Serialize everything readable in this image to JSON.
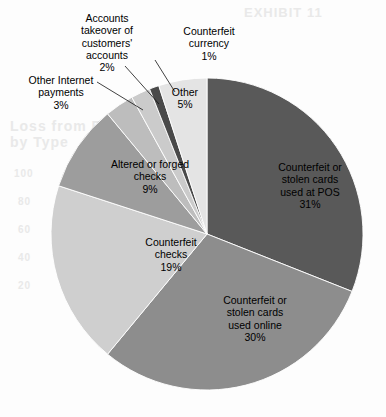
{
  "chart_data": {
    "type": "pie",
    "title": "",
    "legend_position": "none",
    "grid": false,
    "categories": [
      "Counterfeit or stolen cards used at POS",
      "Counterfeit or stolen cards used online",
      "Counterfeit checks",
      "Altered or forged checks",
      "Other Internet payments",
      "Accounts takeover of customers' accounts",
      "Counterfeit currency",
      "Other"
    ],
    "values": [
      31,
      30,
      19,
      9,
      3,
      2,
      1,
      5
    ],
    "units": "percent",
    "slices": [
      {
        "label": "Counterfeit or\nstolen cards\nused at POS",
        "value_label": "31%",
        "value": 31,
        "color": "#595959",
        "label_placement": "inside",
        "label_x": 264,
        "label_y": 161,
        "label_width": 92
      },
      {
        "label": "Counterfeit or\nstolen cards\nused online",
        "value_label": "30%",
        "value": 30,
        "color": "#8d8d8d",
        "label_placement": "inside",
        "label_x": 206,
        "label_y": 294,
        "label_width": 98
      },
      {
        "label": "Counterfeit\nchecks",
        "value_label": "19%",
        "value": 19,
        "color": "#cfcfcf",
        "label_placement": "inside",
        "label_x": 128,
        "label_y": 236,
        "label_width": 86
      },
      {
        "label": "Altered or forged\nchecks",
        "value_label": "9%",
        "value": 9,
        "color": "#9d9d9d",
        "label_placement": "inside",
        "label_x": 92,
        "label_y": 158,
        "label_width": 116
      },
      {
        "label": "Other Internet\npayments",
        "value_label": "3%",
        "value": 3,
        "color": "#bdbdbd",
        "label_placement": "outside",
        "label_x": 12,
        "label_y": 74,
        "label_width": 98
      },
      {
        "label": "Accounts\ntakeover of\ncustomers'\naccounts",
        "value_label": "2%",
        "value": 2,
        "color": "#cbcbcb",
        "label_placement": "outside",
        "label_x": 61,
        "label_y": 12,
        "label_width": 92
      },
      {
        "label": "Counterfeit\ncurrency",
        "value_label": "1%",
        "value": 1,
        "color": "#4a4a4a",
        "label_placement": "outside",
        "label_x": 163,
        "label_y": 25,
        "label_width": 92
      },
      {
        "label": "Other",
        "value_label": "5%",
        "value": 5,
        "color": "#e4e4e4",
        "label_placement": "inside",
        "label_x": 156,
        "label_y": 86,
        "label_width": 58
      }
    ],
    "geometry": {
      "center_x": 207,
      "center_y": 234,
      "radius": 156,
      "start_angle_deg": -90,
      "direction": "clockwise"
    },
    "leader_lines": [
      {
        "name": "leader-line-other-internet-payments",
        "x1": 97,
        "y1": 82,
        "x2": 143,
        "y2": 110
      },
      {
        "name": "leader-line-accounts-takeover",
        "x1": 125,
        "y1": 66,
        "x2": 159,
        "y2": 104
      },
      {
        "name": "leader-line-counterfeit-currency",
        "x1": 155,
        "y1": 60,
        "x2": 175,
        "y2": 92
      }
    ]
  },
  "background_bleed": [
    {
      "text": "EXHIBIT 11",
      "x": 244,
      "y": 5,
      "size": 13
    },
    {
      "text": "Loss from Fraud",
      "x": 10,
      "y": 118,
      "size": 14
    },
    {
      "text": "by Type",
      "x": 10,
      "y": 134,
      "size": 14
    },
    {
      "text": "100",
      "x": 14,
      "y": 168,
      "size": 10
    },
    {
      "text": "80",
      "x": 18,
      "y": 196,
      "size": 10
    },
    {
      "text": "60",
      "x": 18,
      "y": 224,
      "size": 10
    },
    {
      "text": "40",
      "x": 18,
      "y": 252,
      "size": 10
    },
    {
      "text": "20",
      "x": 18,
      "y": 280,
      "size": 10
    }
  ]
}
